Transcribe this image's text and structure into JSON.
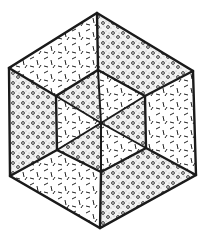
{
  "figure": {
    "title": "",
    "ink_color": "#1a1a1a",
    "background_color": "#ffffff",
    "outer_hexagon": [
      [
        97,
        13
      ],
      [
        193,
        71
      ],
      [
        196,
        175
      ],
      [
        100,
        228
      ],
      [
        10,
        176
      ],
      [
        9,
        68
      ]
    ],
    "inner_hexagon": [
      [
        98,
        70
      ],
      [
        145,
        96
      ],
      [
        146,
        148
      ],
      [
        101,
        172
      ],
      [
        57,
        150
      ],
      [
        56,
        96
      ]
    ],
    "center": [
      101,
      123
    ],
    "textures": {
      "dash": "short dashes pattern",
      "dot": "stippled dots with small circles pattern"
    },
    "outer_faces": [
      {
        "name": "outer-top-left",
        "texture": "dash"
      },
      {
        "name": "outer-top-right",
        "texture": "dot"
      },
      {
        "name": "outer-right",
        "texture": "dash"
      },
      {
        "name": "outer-bottom-right",
        "texture": "dot"
      },
      {
        "name": "outer-bottom-left",
        "texture": "dash"
      },
      {
        "name": "outer-left",
        "texture": "dot"
      }
    ],
    "inner_faces": [
      {
        "name": "inner-top-left",
        "texture": "dot"
      },
      {
        "name": "inner-top-right",
        "texture": "dash"
      },
      {
        "name": "inner-right",
        "texture": "dot"
      },
      {
        "name": "inner-bottom-right",
        "texture": "dash"
      },
      {
        "name": "inner-bottom-left",
        "texture": "dot"
      },
      {
        "name": "inner-left",
        "texture": "dash"
      }
    ]
  }
}
